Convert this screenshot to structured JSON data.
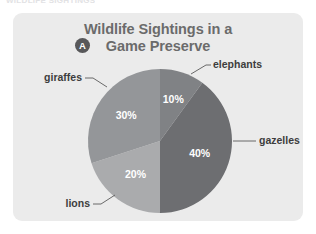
{
  "page": {
    "clipped_header_text": "WILDLIFE SIGHTINGS",
    "card_background": "#ebebeb",
    "page_background": "#ffffff"
  },
  "figure": {
    "badge_letter": "A",
    "title_line_1": "Wildlife Sightings in a",
    "title_line_2": "Game Preserve",
    "title_color": "#6b6b6b"
  },
  "chart_data": {
    "type": "pie",
    "title": "Wildlife Sightings in a Game Preserve",
    "xlabel": "",
    "ylabel": "",
    "legend_position": "callout-labels",
    "grid": false,
    "start_angle_deg": 0,
    "direction": "clockwise",
    "units": "percent",
    "total": 100,
    "categories": [
      "elephants",
      "gazelles",
      "lions",
      "giraffes"
    ],
    "values": [
      10,
      40,
      20,
      30
    ],
    "value_labels": [
      "10%",
      "40%",
      "20%",
      "30%"
    ],
    "colors": [
      "#808285",
      "#6d6e71",
      "#aaabad",
      "#949699"
    ],
    "slices": [
      {
        "label": "elephants",
        "value": 10,
        "value_label": "10%",
        "color": "#808285",
        "start_deg": 0,
        "end_deg": 36,
        "label_side": "top-right"
      },
      {
        "label": "gazelles",
        "value": 40,
        "value_label": "40%",
        "color": "#6d6e71",
        "start_deg": 36,
        "end_deg": 180,
        "label_side": "right"
      },
      {
        "label": "lions",
        "value": 20,
        "value_label": "20%",
        "color": "#aaabad",
        "start_deg": 180,
        "end_deg": 252,
        "label_side": "bottom-left"
      },
      {
        "label": "giraffes",
        "value": 30,
        "value_label": "30%",
        "color": "#949699",
        "start_deg": 252,
        "end_deg": 360,
        "label_side": "top-left"
      }
    ]
  }
}
